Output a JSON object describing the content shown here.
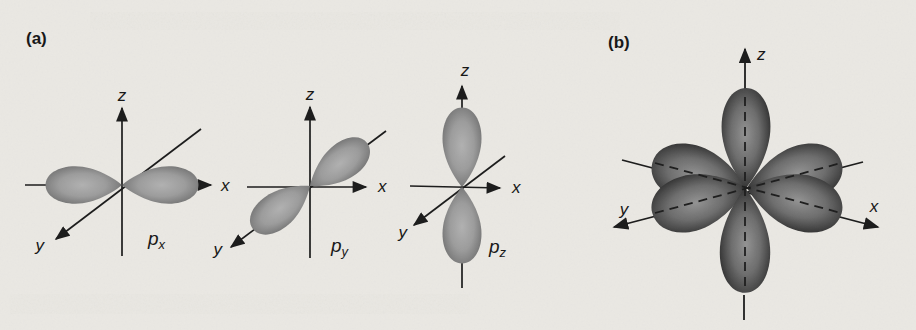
{
  "colors": {
    "paper": "#eae8e3",
    "ink": "#1b1b1b",
    "lobe_a_center": "#adadad",
    "lobe_a_edge": "#5e5e5e",
    "lobe_b_center": "#909090",
    "lobe_b_edge": "#1f1f1f"
  },
  "panel_a": {
    "label": "(a)",
    "diagrams": [
      {
        "id": "px",
        "axes": {
          "z": "z",
          "x": "x",
          "y": "y"
        },
        "orbital": {
          "base": "p",
          "sub": "x"
        }
      },
      {
        "id": "py",
        "axes": {
          "z": "z",
          "x": "x",
          "y": "y"
        },
        "orbital": {
          "base": "p",
          "sub": "y"
        }
      },
      {
        "id": "pz",
        "axes": {
          "z": "z",
          "x": "x",
          "y": "y"
        },
        "orbital": {
          "base": "p",
          "sub": "z"
        }
      }
    ]
  },
  "panel_b": {
    "label": "(b)",
    "axes": {
      "z": "z",
      "x": "x",
      "y": "y"
    }
  }
}
